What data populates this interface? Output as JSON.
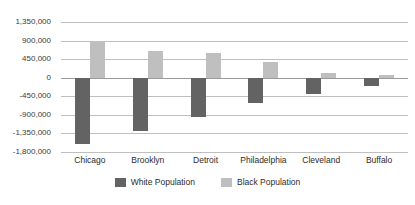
{
  "chart_data": {
    "type": "bar",
    "title": "",
    "subtitle": "",
    "xlabel": "",
    "ylabel": "",
    "categories": [
      "Chicago",
      "Brooklyn",
      "Detroit",
      "Philadelphia",
      "Cleveland",
      "Buffalo"
    ],
    "series": [
      {
        "name": "White Population",
        "color": "#636363",
        "values": [
          -1600000,
          -1300000,
          -950000,
          -620000,
          -400000,
          -200000
        ]
      },
      {
        "name": "Black Population",
        "color": "#bfbfbf",
        "values": [
          880000,
          650000,
          600000,
          380000,
          120000,
          60000
        ]
      }
    ],
    "ylim": [
      -1800000,
      1350000
    ],
    "ytick_values": [
      1350000,
      900000,
      450000,
      0,
      -450000,
      -900000,
      -1350000,
      -1800000
    ],
    "ytick_labels": [
      "1,350,000",
      "900,000",
      "450,000",
      "0",
      "-450,000",
      "-900,000",
      "-1,350,000",
      "-1,800,000"
    ],
    "grid": true,
    "legend_position": "bottom",
    "orientation": "vertical",
    "baseline": 0
  },
  "colors": {
    "gridline": "#bfbfbf",
    "axis": "#9a9a9a",
    "text": "#2b2b2b",
    "background": "#ffffff"
  }
}
